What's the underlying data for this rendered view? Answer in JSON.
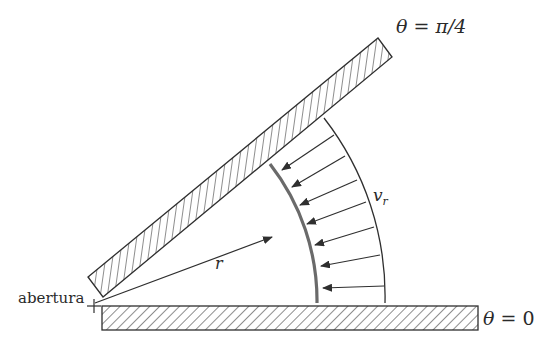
{
  "labels": {
    "aperture": "abertura",
    "radius": "r",
    "velocity_symbol": "v",
    "velocity_subscript": "r",
    "top_wall_theta": "θ",
    "top_wall_eq": " = ",
    "top_wall_value": "π/4",
    "bottom_wall_theta": "θ",
    "bottom_wall_eq": " = ",
    "bottom_wall_value": "0"
  },
  "geometry": {
    "origin": [
      95,
      303
    ],
    "inner_radius": 222,
    "outer_radius": 290,
    "wall_angle_deg": 39.5,
    "arrow_count": 7
  },
  "colors": {
    "line": "#2f2f2f",
    "inner_arc": "#6a6a6a",
    "background": "#ffffff"
  }
}
